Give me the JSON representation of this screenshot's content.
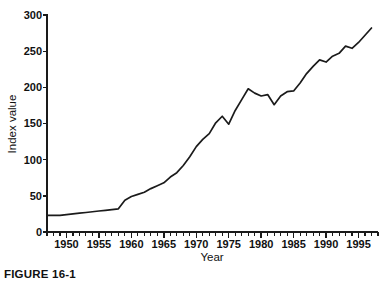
{
  "figure": {
    "caption": "FIGURE 16-1"
  },
  "chart_data": {
    "type": "line",
    "title": "",
    "xlabel": "Year",
    "ylabel": "Index value",
    "xlim": [
      1947,
      1998
    ],
    "ylim": [
      0,
      300
    ],
    "grid": false,
    "legend": "none",
    "x_major_ticks": [
      1950,
      1955,
      1960,
      1965,
      1970,
      1975,
      1980,
      1985,
      1990,
      1995
    ],
    "x_tick_labels": [
      "1950",
      "1955",
      "1960",
      "1965",
      "1970",
      "1975",
      "1980",
      "1985",
      "1990",
      "1995"
    ],
    "x_minor_tick_step": 1,
    "y_major_ticks": [
      0,
      50,
      100,
      150,
      200,
      250,
      300
    ],
    "y_tick_labels": [
      "0",
      "50",
      "100",
      "150",
      "200",
      "250",
      "300"
    ],
    "series": [
      {
        "name": "Index value",
        "x": [
          1947,
          1948,
          1949,
          1950,
          1951,
          1952,
          1953,
          1954,
          1955,
          1956,
          1957,
          1958,
          1959,
          1960,
          1961,
          1962,
          1963,
          1964,
          1965,
          1966,
          1967,
          1968,
          1969,
          1970,
          1971,
          1972,
          1973,
          1974,
          1975,
          1976,
          1977,
          1978,
          1979,
          1980,
          1981,
          1982,
          1983,
          1984,
          1985,
          1986,
          1987,
          1988,
          1989,
          1990,
          1991,
          1992,
          1993,
          1994,
          1995,
          1996,
          1997
        ],
        "values": [
          23,
          23,
          23,
          24,
          25,
          26,
          27,
          28,
          29,
          30,
          31,
          32,
          44,
          49,
          52,
          55,
          60,
          64,
          68,
          76,
          82,
          92,
          104,
          118,
          128,
          136,
          151,
          160,
          149,
          168,
          183,
          198,
          192,
          188,
          190,
          176,
          188,
          194,
          195,
          206,
          219,
          229,
          238,
          235,
          243,
          247,
          257,
          254,
          262,
          272,
          282
        ]
      }
    ]
  }
}
